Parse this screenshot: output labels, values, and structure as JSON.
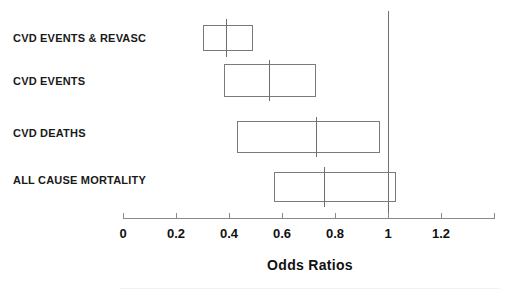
{
  "chart_data": {
    "type": "bar",
    "title": "",
    "subtitle": "",
    "xlabel": "Odds Ratios",
    "ylabel": "",
    "xlim": [
      0,
      1.4
    ],
    "xticks": [
      0,
      0.2,
      0.4,
      0.6,
      0.8,
      1,
      1.2
    ],
    "xticklabels": [
      "0",
      "0.2",
      "0.4",
      "0.6",
      "0.8",
      "1",
      "1.2"
    ],
    "grid": false,
    "legend": null,
    "reference_line": 1,
    "orientation": "horizontal",
    "note": "Horizontal odds-ratio plot: each outcome drawn as an open rectangle spanning the confidence interval with a vertical tick at the point estimate.",
    "categories": [
      "CVD EVENTS & REVASC",
      "CVD EVENTS",
      "CVD DEATHS",
      "ALL CAUSE MORTALITY"
    ],
    "values": [
      0.39,
      0.55,
      0.73,
      0.76
    ],
    "ci_low": [
      0.3,
      0.38,
      0.43,
      0.57
    ],
    "ci_high": [
      0.49,
      0.73,
      0.97,
      1.03
    ],
    "series": [
      {
        "name": "Odds Ratio",
        "points": [
          {
            "label": "CVD EVENTS & REVASC",
            "value": 0.39,
            "ci_low": 0.3,
            "ci_high": 0.49
          },
          {
            "label": "CVD EVENTS",
            "value": 0.55,
            "ci_low": 0.38,
            "ci_high": 0.73
          },
          {
            "label": "CVD DEATHS",
            "value": 0.73,
            "ci_low": 0.43,
            "ci_high": 0.97
          },
          {
            "label": "ALL CAUSE MORTALITY",
            "value": 0.76,
            "ci_low": 0.57,
            "ci_high": 1.03
          }
        ]
      }
    ]
  },
  "colors": {
    "background": "#ffffff",
    "box_stroke": "#7b7b7b",
    "axis": "#8a8a8a",
    "reference_line": "#6e6e6e",
    "text": "#111111"
  }
}
